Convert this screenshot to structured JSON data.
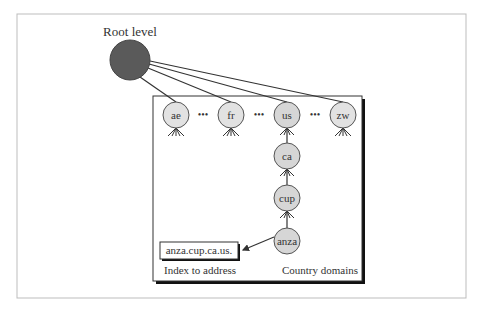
{
  "diagram": {
    "title_label": "Root level",
    "root": {
      "cx": 130,
      "cy": 60,
      "r": 20,
      "fill": "#5a5a5a"
    },
    "nodes": [
      {
        "id": "ae",
        "label": "ae",
        "cx": 176,
        "cy": 115
      },
      {
        "id": "fr",
        "label": "fr",
        "cx": 231,
        "cy": 115
      },
      {
        "id": "us",
        "label": "us",
        "cx": 287,
        "cy": 115
      },
      {
        "id": "zw",
        "label": "zw",
        "cx": 343,
        "cy": 115
      },
      {
        "id": "ca",
        "label": "ca",
        "cx": 287,
        "cy": 156
      },
      {
        "id": "cup",
        "label": "cup",
        "cx": 287,
        "cy": 198
      },
      {
        "id": "anza",
        "label": "anza",
        "cx": 287,
        "cy": 241
      }
    ],
    "ellipsis": "•••",
    "address_box_label": "anza.cup.ca.us.",
    "index_caption": "Index to address",
    "domain_caption": "Country domains",
    "colors": {
      "node_fill": "#dcdcdc",
      "node_stroke": "#555555",
      "frame": "#bdbdbd",
      "line": "#333333"
    }
  }
}
